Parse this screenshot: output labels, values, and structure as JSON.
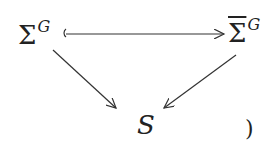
{
  "diagram": {
    "type": "commutative-diagram",
    "nodes": {
      "left": {
        "base": "Σ",
        "sup": "G"
      },
      "right": {
        "base": "Σ",
        "sup": "G",
        "overline": true
      },
      "bottom": {
        "label": "S"
      }
    },
    "trailing": ")",
    "edges": [
      {
        "from": "left",
        "to": "right",
        "style": "hook-arrow"
      },
      {
        "from": "left",
        "to": "bottom",
        "style": "arrow"
      },
      {
        "from": "right",
        "to": "bottom",
        "style": "arrow"
      }
    ],
    "color": "#222222"
  }
}
